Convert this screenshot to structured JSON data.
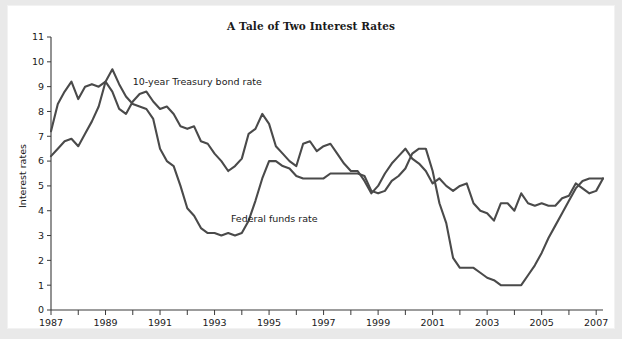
{
  "chart_data": {
    "type": "line",
    "title": "A Tale of Two Interest Rates",
    "xlabel": "",
    "ylabel": "Interest rates",
    "xlim": [
      1987,
      2007.25
    ],
    "ylim": [
      0,
      11
    ],
    "grid": false,
    "legend_position": "inline-annotations",
    "ytick_labels": [
      "0",
      "1",
      "2",
      "3",
      "4",
      "5",
      "6",
      "7",
      "8",
      "9",
      "10",
      "11"
    ],
    "ytick_values": [
      0,
      1,
      2,
      3,
      4,
      5,
      6,
      7,
      8,
      9,
      10,
      11
    ],
    "xtick_labels": [
      "1987",
      "1989",
      "1991",
      "1993",
      "1995",
      "1997",
      "1999",
      "2001",
      "2003",
      "2005",
      "2007"
    ],
    "xtick_values": [
      1987,
      1989,
      1991,
      1993,
      1995,
      1997,
      1999,
      2001,
      2003,
      2005,
      2007
    ],
    "xminor_tick_values": [
      1988,
      1990,
      1992,
      1994,
      1996,
      1998,
      2000,
      2002,
      2004,
      2006
    ],
    "annotations": [
      {
        "text": "10-year Treasury bond rate",
        "x": 1990.0,
        "y": 9.05
      },
      {
        "text": "Federal funds rate",
        "x": 1993.6,
        "y": 3.55
      }
    ],
    "series": [
      {
        "name": "10-year Treasury bond rate",
        "color": "#4a4a4a",
        "x": [
          1987.0,
          1987.25,
          1987.5,
          1987.75,
          1988.0,
          1988.25,
          1988.5,
          1988.75,
          1989.0,
          1989.25,
          1989.5,
          1989.75,
          1990.0,
          1990.25,
          1990.5,
          1990.75,
          1991.0,
          1991.25,
          1991.5,
          1991.75,
          1992.0,
          1992.25,
          1992.5,
          1992.75,
          1993.0,
          1993.25,
          1993.5,
          1993.75,
          1994.0,
          1994.25,
          1994.5,
          1994.75,
          1995.0,
          1995.25,
          1995.5,
          1995.75,
          1996.0,
          1996.25,
          1996.5,
          1996.75,
          1997.0,
          1997.25,
          1997.5,
          1997.75,
          1998.0,
          1998.25,
          1998.5,
          1998.75,
          1999.0,
          1999.25,
          1999.5,
          1999.75,
          2000.0,
          2000.25,
          2000.5,
          2000.75,
          2001.0,
          2001.25,
          2001.5,
          2001.75,
          2002.0,
          2002.25,
          2002.5,
          2002.75,
          2003.0,
          2003.25,
          2003.5,
          2003.75,
          2004.0,
          2004.25,
          2004.5,
          2004.75,
          2005.0,
          2005.25,
          2005.5,
          2005.75,
          2006.0,
          2006.25,
          2006.5,
          2006.75,
          2007.0,
          2007.25
        ],
        "y": [
          7.2,
          8.3,
          8.8,
          9.2,
          8.5,
          9.0,
          9.1,
          9.0,
          9.2,
          8.8,
          8.1,
          7.9,
          8.4,
          8.7,
          8.8,
          8.4,
          8.1,
          8.2,
          7.9,
          7.4,
          7.3,
          7.4,
          6.8,
          6.7,
          6.3,
          6.0,
          5.6,
          5.8,
          6.1,
          7.1,
          7.3,
          7.9,
          7.5,
          6.6,
          6.3,
          6.0,
          5.8,
          6.7,
          6.8,
          6.4,
          6.6,
          6.7,
          6.3,
          5.9,
          5.6,
          5.6,
          5.2,
          4.7,
          5.0,
          5.5,
          5.9,
          6.2,
          6.5,
          6.1,
          5.9,
          5.6,
          5.1,
          5.3,
          5.0,
          4.8,
          5.0,
          5.1,
          4.3,
          4.0,
          3.9,
          3.6,
          4.3,
          4.3,
          4.0,
          4.7,
          4.3,
          4.2,
          4.3,
          4.2,
          4.2,
          4.5,
          4.6,
          5.1,
          4.9,
          4.7,
          4.8,
          5.3
        ]
      },
      {
        "name": "Federal funds rate",
        "color": "#4a4a4a",
        "x": [
          1987.0,
          1987.25,
          1987.5,
          1987.75,
          1988.0,
          1988.25,
          1988.5,
          1988.75,
          1989.0,
          1989.25,
          1989.5,
          1989.75,
          1990.0,
          1990.25,
          1990.5,
          1990.75,
          1991.0,
          1991.25,
          1991.5,
          1991.75,
          1992.0,
          1992.25,
          1992.5,
          1992.75,
          1993.0,
          1993.25,
          1993.5,
          1993.75,
          1994.0,
          1994.25,
          1994.5,
          1994.75,
          1995.0,
          1995.25,
          1995.5,
          1995.75,
          1996.0,
          1996.25,
          1996.5,
          1996.75,
          1997.0,
          1997.25,
          1997.5,
          1997.75,
          1998.0,
          1998.25,
          1998.5,
          1998.75,
          1999.0,
          1999.25,
          1999.5,
          1999.75,
          2000.0,
          2000.25,
          2000.5,
          2000.75,
          2001.0,
          2001.25,
          2001.5,
          2001.75,
          2002.0,
          2002.25,
          2002.5,
          2002.75,
          2003.0,
          2003.25,
          2003.5,
          2003.75,
          2004.0,
          2004.25,
          2004.5,
          2004.75,
          2005.0,
          2005.25,
          2005.5,
          2005.75,
          2006.0,
          2006.25,
          2006.5,
          2006.75,
          2007.0,
          2007.25
        ],
        "y": [
          6.2,
          6.5,
          6.8,
          6.9,
          6.6,
          7.1,
          7.6,
          8.2,
          9.2,
          9.7,
          9.1,
          8.6,
          8.3,
          8.2,
          8.1,
          7.7,
          6.5,
          6.0,
          5.8,
          5.0,
          4.1,
          3.8,
          3.3,
          3.1,
          3.1,
          3.0,
          3.1,
          3.0,
          3.1,
          3.6,
          4.4,
          5.3,
          6.0,
          6.0,
          5.8,
          5.7,
          5.4,
          5.3,
          5.3,
          5.3,
          5.3,
          5.5,
          5.5,
          5.5,
          5.5,
          5.5,
          5.4,
          4.8,
          4.7,
          4.8,
          5.2,
          5.4,
          5.7,
          6.3,
          6.5,
          6.5,
          5.6,
          4.3,
          3.5,
          2.1,
          1.7,
          1.7,
          1.7,
          1.5,
          1.3,
          1.2,
          1.0,
          1.0,
          1.0,
          1.0,
          1.4,
          1.8,
          2.3,
          2.9,
          3.4,
          3.9,
          4.4,
          4.9,
          5.2,
          5.3,
          5.3,
          5.3
        ]
      }
    ]
  },
  "card": {
    "title": "A Tale of Two Interest Rates",
    "y_axis_title": "Interest rates"
  }
}
